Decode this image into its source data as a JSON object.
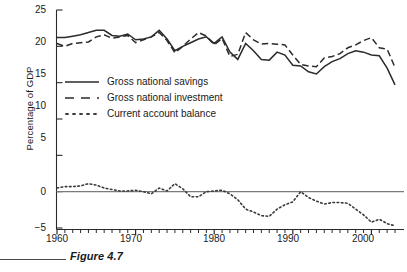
{
  "figure": {
    "caption_label": "Figure 4.7",
    "caption_partial": "",
    "rule_color": "#4a4a4a"
  },
  "axes": {
    "y_title": "Percentage of GDP",
    "y_ticks": [
      "25",
      "20",
      "15",
      "10",
      "5",
      "0",
      "−5"
    ],
    "x_ticks": [
      "1960",
      "1970",
      "1980",
      "1990",
      "2000"
    ]
  },
  "legend": {
    "position": "inside-upper-left",
    "entries": [
      {
        "label": "Gross national savings",
        "style": "solid",
        "key": "solid-line-key"
      },
      {
        "label": "Gross national investment",
        "style": "dashed",
        "key": "dashed-line-key"
      },
      {
        "label": "Current account balance",
        "style": "dotted",
        "key": "dotted-line-key"
      }
    ]
  },
  "chart_data": {
    "type": "line",
    "title": "",
    "subtitle": "",
    "xlabel": "",
    "ylabel": "Percentage of GDP",
    "xlim": [
      1960,
      2003
    ],
    "ylim": [
      -5,
      25
    ],
    "grid": false,
    "legend_position": "inside-upper-left",
    "zero_reference_line": 0,
    "x": [
      1960,
      1961,
      1962,
      1963,
      1964,
      1965,
      1966,
      1967,
      1968,
      1969,
      1970,
      1971,
      1972,
      1973,
      1974,
      1975,
      1976,
      1977,
      1978,
      1979,
      1980,
      1981,
      1982,
      1983,
      1984,
      1985,
      1986,
      1987,
      1988,
      1989,
      1990,
      1991,
      1992,
      1993,
      1994,
      1995,
      1996,
      1997,
      1998,
      1999,
      2000,
      2001,
      2002,
      2003
    ],
    "series": [
      {
        "name": "Gross national savings",
        "style": "solid",
        "color": "#2b2b2b",
        "values": [
          21.2,
          21.2,
          21.4,
          21.6,
          21.9,
          22.2,
          22.2,
          21.5,
          21.4,
          21.7,
          20.9,
          21.0,
          21.3,
          22.2,
          21.0,
          19.4,
          20.0,
          20.5,
          21.0,
          21.3,
          20.4,
          21.3,
          19.2,
          18.2,
          20.4,
          19.4,
          18.2,
          18.1,
          19.2,
          18.8,
          17.4,
          17.3,
          16.5,
          16.2,
          17.2,
          17.9,
          18.3,
          19.0,
          19.4,
          19.2,
          18.8,
          18.7,
          17.0,
          14.7
        ]
      },
      {
        "name": "Gross national investment",
        "style": "dashed",
        "color": "#2b2b2b",
        "values": [
          20.4,
          20.0,
          20.4,
          20.5,
          20.6,
          21.3,
          21.6,
          21.1,
          21.3,
          21.5,
          20.5,
          20.9,
          21.3,
          21.9,
          20.8,
          19.1,
          20.0,
          21.0,
          21.9,
          21.4,
          20.2,
          21.1,
          18.6,
          18.9,
          21.9,
          20.9,
          20.3,
          20.4,
          20.3,
          20.2,
          18.8,
          17.5,
          17.3,
          17.2,
          18.4,
          18.6,
          19.0,
          19.8,
          20.2,
          20.8,
          21.2,
          19.8,
          19.6,
          17.1
        ]
      },
      {
        "name": "Current account balance",
        "style": "dotted",
        "color": "#3a3a3a",
        "values": [
          0.5,
          0.7,
          0.7,
          0.8,
          1.1,
          0.9,
          0.5,
          0.3,
          0.1,
          0.1,
          0.2,
          0.0,
          -0.3,
          0.5,
          0.1,
          1.1,
          0.4,
          -0.7,
          -0.7,
          0.0,
          0.1,
          0.2,
          -0.3,
          -1.1,
          -2.4,
          -2.8,
          -3.3,
          -3.4,
          -2.4,
          -1.8,
          -1.4,
          0.0,
          -0.8,
          -1.3,
          -1.7,
          -1.5,
          -1.5,
          -1.6,
          -2.4,
          -3.2,
          -4.2,
          -3.8,
          -4.4,
          -4.7
        ]
      }
    ]
  }
}
